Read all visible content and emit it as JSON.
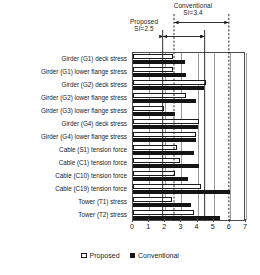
{
  "chart_data": {
    "type": "bar",
    "orientation": "horizontal",
    "title": "",
    "subtitle": "",
    "xlabel": "",
    "ylabel": "",
    "xlim": [
      0,
      7
    ],
    "xticks": [
      0,
      1,
      2,
      3,
      4,
      5,
      6,
      7
    ],
    "grid": true,
    "grid_axis": "x",
    "legend_position": "bottom",
    "categories": [
      "Girder (G1) deck stress",
      "Girder (G1) lower flange stress",
      "Girder (G2) deck stress",
      "Girder (G2) lower flange stress",
      "Girder (G3) lower flange stress",
      "Girder (G4) deck stress",
      "Girder (G4) lower flange stress",
      "Cable (S1) tension force",
      "Cable (C1) tension force",
      "Cable (C10) tension force",
      "Cable (C19) tension force",
      "Tower (T1) stress",
      "Tower (T2) stress"
    ],
    "series": [
      {
        "name": "Proposed",
        "color": "#ffffff",
        "edge_color": "#1a1a1a",
        "values": [
          2.5,
          2.5,
          4.5,
          3.3,
          1.9,
          4.1,
          3.9,
          2.7,
          2.9,
          2.6,
          4.2,
          2.4,
          3.8
        ]
      },
      {
        "name": "Conventional",
        "color": "#141414",
        "edge_color": "#141414",
        "values": [
          3.2,
          3.3,
          4.4,
          3.9,
          2.6,
          4.0,
          3.9,
          3.8,
          4.1,
          3.4,
          6.0,
          3.6,
          5.4
        ]
      }
    ],
    "annotations": [
      {
        "id": "proposed-si",
        "label_line1": "Proposed",
        "label_line2": "SI=2.5",
        "span_start": 1.9,
        "span_end": 4.5,
        "value": 2.5
      },
      {
        "id": "conventional-si",
        "label_line1": "Conventional",
        "label_line2": "SI=3.4",
        "span_start": 2.6,
        "span_end": 6.0,
        "value": 3.4
      }
    ],
    "reference_lines": [
      1.9,
      2.6,
      4.5,
      6.0
    ]
  },
  "legend": {
    "items": [
      {
        "label": "Proposed",
        "style": "open"
      },
      {
        "label": "Conventional",
        "style": "filled"
      }
    ]
  }
}
